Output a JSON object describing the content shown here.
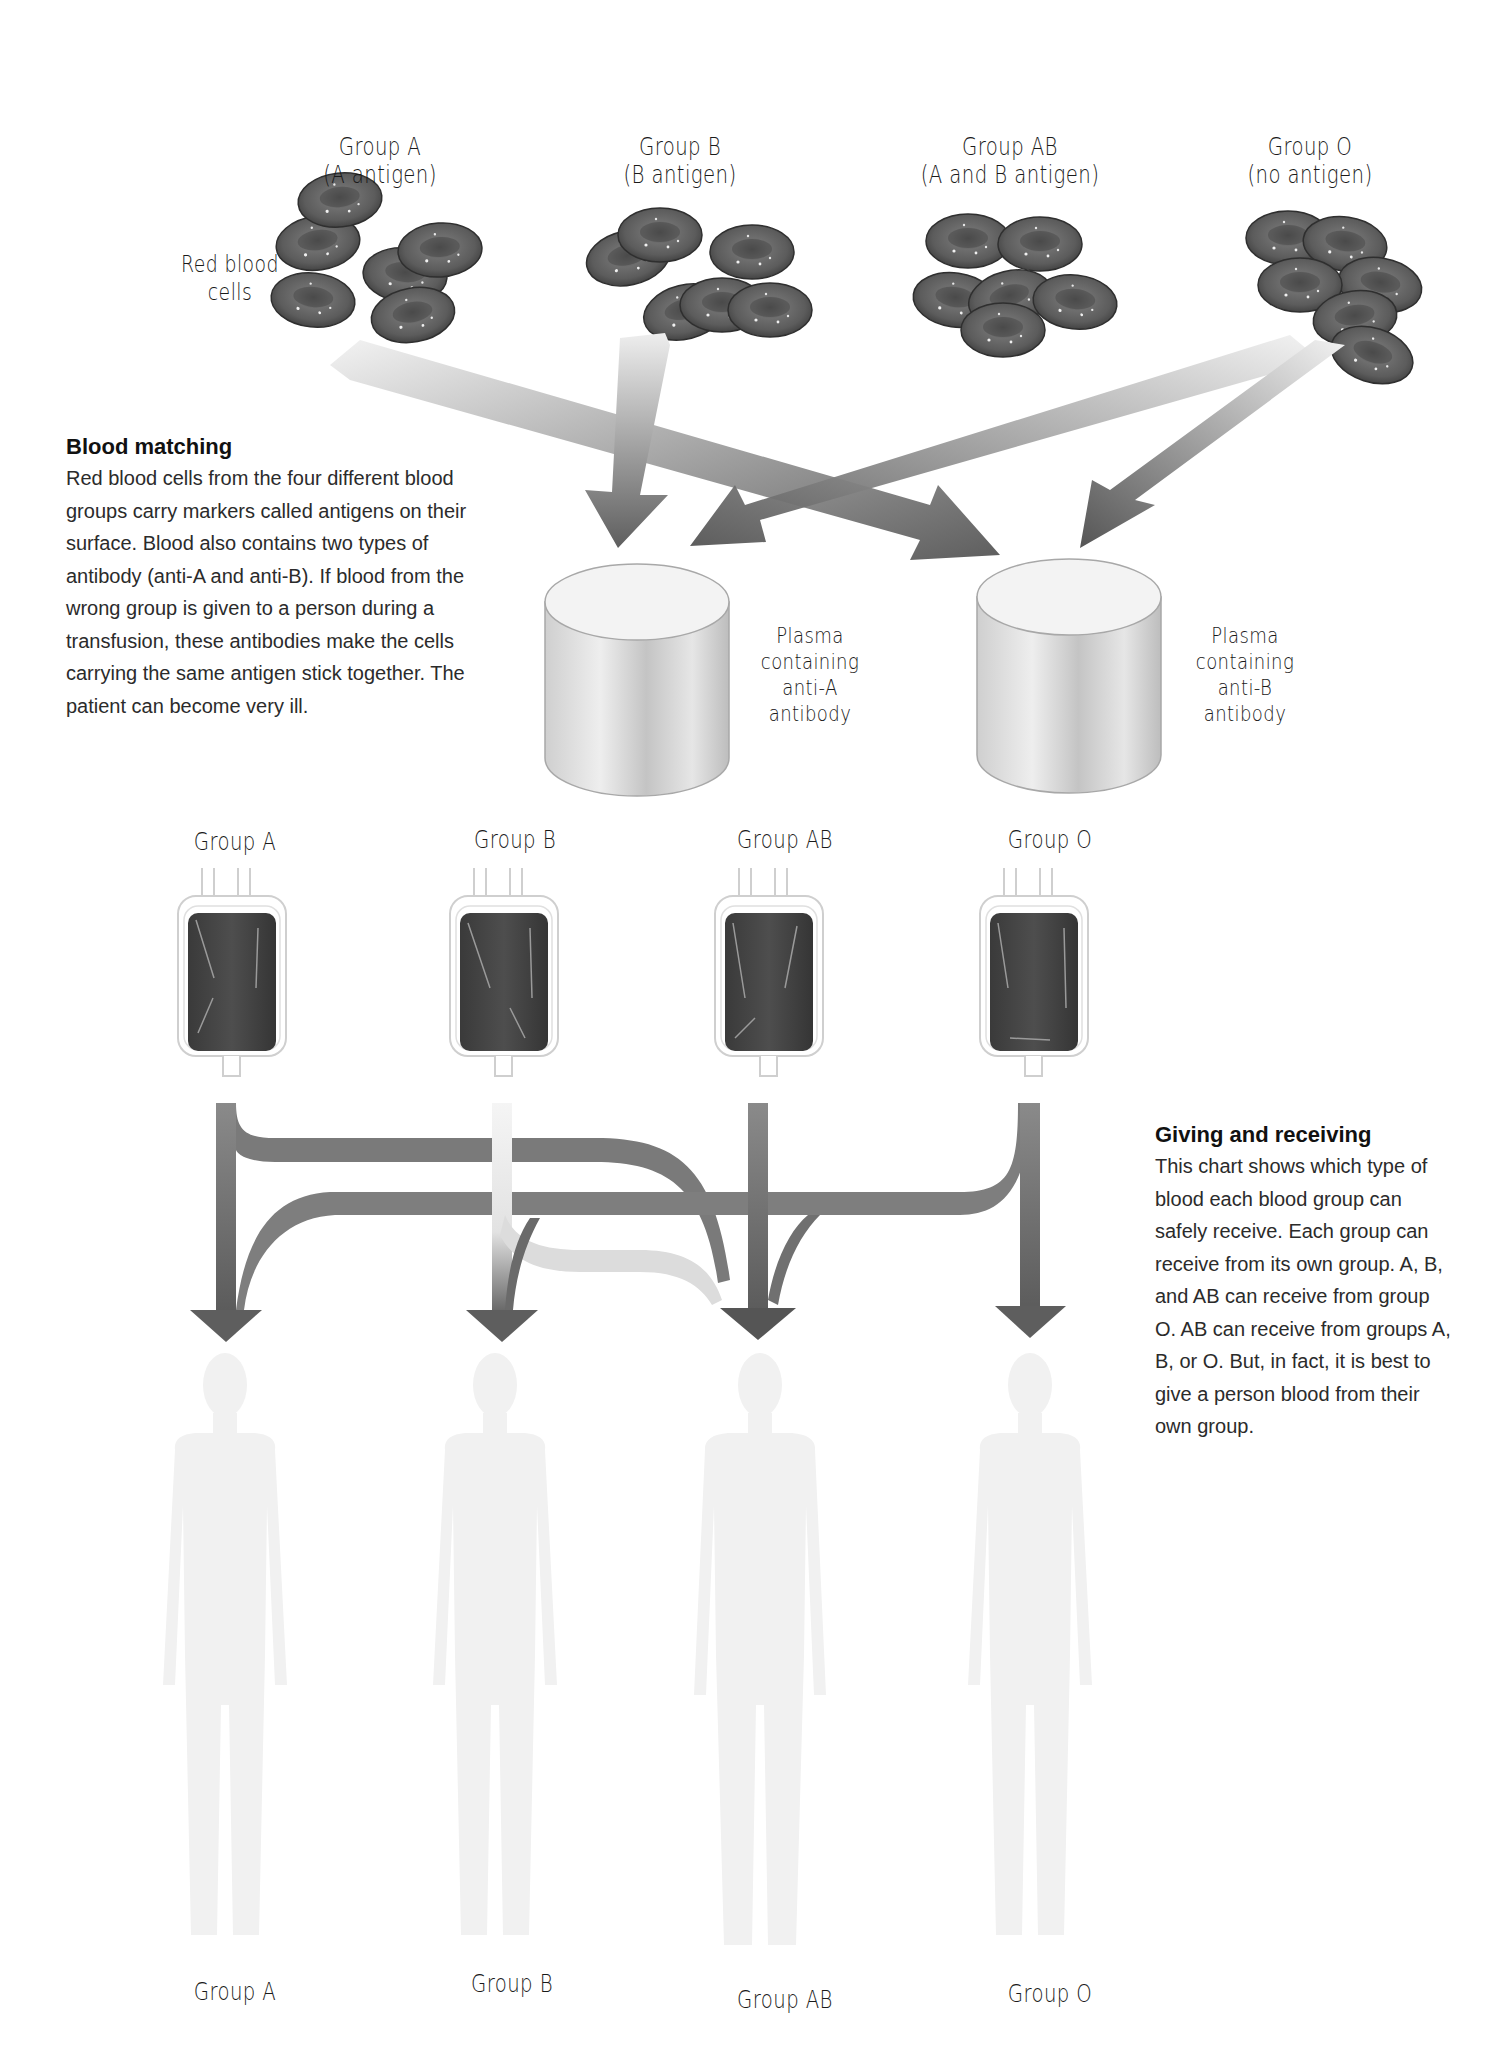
{
  "top_section": {
    "red_cells_label": [
      "Red blood",
      "cells"
    ],
    "groups": [
      {
        "name": "Group A",
        "antigen": "(A antigen)"
      },
      {
        "name": "Group B",
        "antigen": "(B antigen)"
      },
      {
        "name": "Group AB",
        "antigen": "(A and B antigen)"
      },
      {
        "name": "Group O",
        "antigen": "(no antigen)"
      }
    ],
    "plasma": [
      {
        "lines": [
          "Plasma",
          "containing",
          "anti-A",
          "antibody"
        ]
      },
      {
        "lines": [
          "Plasma",
          "containing",
          "anti-B",
          "antibody"
        ]
      }
    ]
  },
  "blood_matching": {
    "title": "Blood matching",
    "text": "Red blood cells from the four different blood groups carry markers called antigens on their surface. Blood also contains two types of antibody (anti-A and anti-B). If blood from the wrong group is given to a person during a transfusion, these antibodies make the cells carrying the same antigen stick together. The patient can become very ill."
  },
  "giving_receiving": {
    "title": "Giving and receiving",
    "text": "This chart shows which type of blood each blood group can safely receive. Each group can receive from its own group. A, B, and AB can receive from group O. AB can receive from groups A, B, or O. But, in fact, it is best to give a person blood from their own group."
  },
  "bags": [
    {
      "label": "Group A"
    },
    {
      "label": "Group B"
    },
    {
      "label": "Group AB"
    },
    {
      "label": "Group O"
    }
  ],
  "recipients": [
    {
      "label": "Group A"
    },
    {
      "label": "Group B"
    },
    {
      "label": "Group AB"
    },
    {
      "label": "Group O"
    }
  ],
  "colors": {
    "cell": "#5a5a5a",
    "arrow_dark": "#6a6a6a",
    "arrow_light": "#e4e4e4",
    "bag_blood": "#3f3f3f",
    "figure": "#f1f1f1"
  }
}
